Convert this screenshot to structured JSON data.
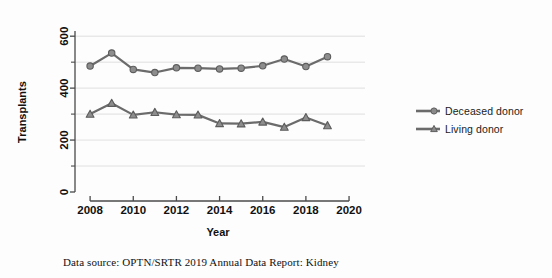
{
  "chart_data": {
    "type": "line",
    "title": "",
    "xlabel": "Year",
    "ylabel": "Transplants",
    "xlim": [
      2007.3,
      2020.6
    ],
    "ylim": [
      0,
      620
    ],
    "xticks": [
      2008,
      2010,
      2012,
      2014,
      2016,
      2018,
      2020
    ],
    "xtick_labels": [
      "2008",
      "2010",
      "2012",
      "2014",
      "2016",
      "2018",
      "2020"
    ],
    "yticks": [
      0,
      200,
      400,
      600
    ],
    "ytick_labels": [
      "0",
      "200",
      "400",
      "600"
    ],
    "yminor_ticks": [
      100,
      300,
      500
    ],
    "gridlines": [
      100,
      200,
      300,
      400,
      500,
      600
    ],
    "grid": true,
    "legend_position": "right",
    "x": [
      2008,
      2009,
      2010,
      2011,
      2012,
      2013,
      2014,
      2015,
      2016,
      2017,
      2018,
      2019
    ],
    "series": [
      {
        "name": "Deceased donor",
        "marker": "circle",
        "color": "#6b6b6b",
        "values": [
          485,
          535,
          472,
          460,
          478,
          477,
          474,
          477,
          486,
          512,
          483,
          521
        ]
      },
      {
        "name": "Living donor",
        "marker": "triangle",
        "color": "#6b6b6b",
        "values": [
          300,
          342,
          297,
          307,
          298,
          297,
          264,
          263,
          270,
          250,
          287,
          256
        ]
      }
    ]
  },
  "legend": {
    "items": [
      {
        "label": "Deceased donor",
        "marker": "circle"
      },
      {
        "label": "Living donor",
        "marker": "triangle"
      }
    ]
  },
  "caption": {
    "text": "Data source: OPTN/SRTR 2019 Annual Data Report: Kidney"
  },
  "style": {
    "series_color": "#6b6b6b",
    "axis_color": "#4a4a4a",
    "grid_color": "#d8d8d8",
    "text_color": "#111111",
    "background": "#fdfdfd"
  }
}
